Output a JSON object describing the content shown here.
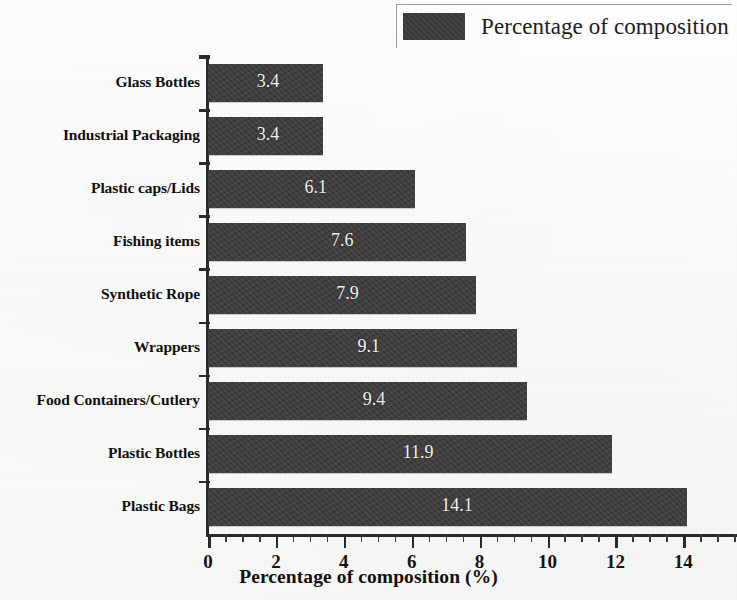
{
  "chart_data": {
    "type": "bar",
    "orientation": "horizontal",
    "title": "",
    "xlabel": "Percentage of composition (%)",
    "ylabel": "",
    "xlim": [
      0,
      15.6
    ],
    "grid": false,
    "legend_position": "top-right",
    "categories": [
      "Glass Bottles",
      "Industrial Packaging",
      "Plastic caps/Lids",
      "Fishing items",
      "Synthetic Rope",
      "Wrappers",
      "Food Containers/Cutlery",
      "Plastic Bottles",
      "Plastic Bags"
    ],
    "values": [
      3.4,
      3.4,
      6.1,
      7.6,
      7.9,
      9.1,
      9.4,
      11.9,
      14.1
    ],
    "value_labels": [
      "3.4",
      "3.4",
      "6.1",
      "7.6",
      "7.9",
      "9.1",
      "9.4",
      "11.9",
      "14.1"
    ],
    "series": [
      {
        "name": "Percentage of composition",
        "values": [
          3.4,
          3.4,
          6.1,
          7.6,
          7.9,
          9.1,
          9.4,
          11.9,
          14.1
        ],
        "color": "#3b3b3b"
      }
    ],
    "xticks": [
      0,
      2,
      4,
      6,
      8,
      10,
      12,
      14
    ],
    "xtick_labels": [
      "0",
      "2",
      "4",
      "6",
      "8",
      "10",
      "12",
      "14"
    ],
    "minor_tick_step": 0.5,
    "bar_color": "#3b3b3b",
    "value_label_color": "#f2f2f2",
    "axis_color": "#2a2a2a",
    "background_color": "#fdfdfc"
  },
  "legend": {
    "label": "Percentage of composition",
    "swatch_color": "#3b3b3b",
    "swatch_icon": "filled-square-swatch"
  },
  "axis": {
    "x_title": "Percentage of composition (%)"
  }
}
